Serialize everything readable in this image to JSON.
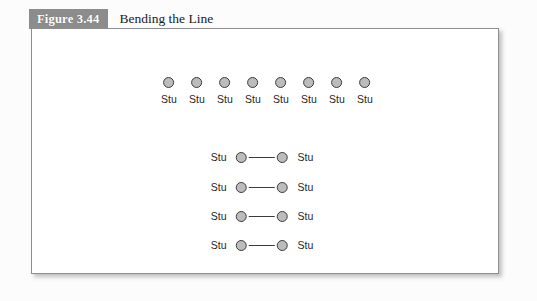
{
  "figure": {
    "badge": "Figure 3.44",
    "title": "Bending the Line"
  },
  "colors": {
    "badge_background": "#8c8c8c",
    "badge_text": "#ffffff",
    "panel_background": "#ffffff",
    "panel_border": "#8e8e8e",
    "node_fill": "#bcbcbc",
    "node_stroke": "#3b3b3b",
    "label_text": "#1f1f1f",
    "canvas_background": "#fcfcfc"
  },
  "diagram": {
    "top_row": {
      "label": "Stu",
      "nodes": [
        {
          "label": "Stu"
        },
        {
          "label": "Stu"
        },
        {
          "label": "Stu"
        },
        {
          "label": "Stu"
        },
        {
          "label": "Stu"
        },
        {
          "label": "Stu"
        },
        {
          "label": "Stu"
        },
        {
          "label": "Stu"
        }
      ]
    },
    "pair_rows": [
      {
        "left_label": "Stu",
        "right_label": "Stu"
      },
      {
        "left_label": "Stu",
        "right_label": "Stu"
      },
      {
        "left_label": "Stu",
        "right_label": "Stu"
      },
      {
        "left_label": "Stu",
        "right_label": "Stu"
      }
    ]
  }
}
